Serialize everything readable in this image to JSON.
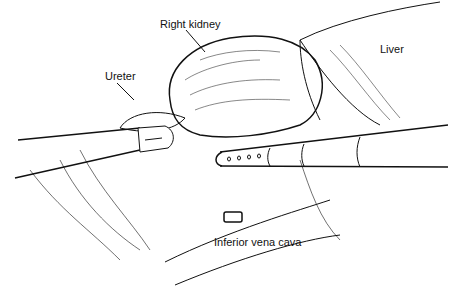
{
  "figure": {
    "type": "surgical line illustration",
    "labels": {
      "right_kidney": "Right kidney",
      "liver": "Liver",
      "ureter": "Ureter",
      "ivc": "Inferior vena cava"
    },
    "instruments": [
      {
        "name": "grasper",
        "side": "left"
      },
      {
        "name": "suction-irrigator",
        "side": "right",
        "holes": 4
      }
    ],
    "colors": {
      "ink": "#111111",
      "background": "#ffffff"
    }
  }
}
